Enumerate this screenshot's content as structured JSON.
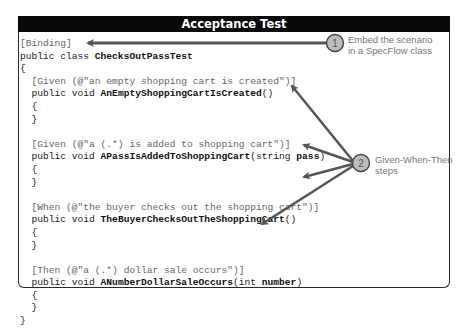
{
  "title": "Acceptance Test",
  "code": {
    "lines": [
      {
        "indent": "",
        "attr": "[Binding]",
        "pre": "",
        "bold": "",
        "post": ""
      },
      {
        "indent": "",
        "attr": "",
        "pre": "public class ",
        "bold": "ChecksOutPassTest",
        "post": ""
      },
      {
        "indent": "",
        "attr": "",
        "pre": "{",
        "bold": "",
        "post": ""
      },
      {
        "indent": "  ",
        "attr": "[Given (@\"an empty shopping cart is created\")]",
        "pre": "",
        "bold": "",
        "post": ""
      },
      {
        "indent": "  ",
        "attr": "",
        "pre": "public void ",
        "bold": "AnEmptyShoppingCartIsCreated",
        "post": "()"
      },
      {
        "indent": "  ",
        "attr": "",
        "pre": "{",
        "bold": "",
        "post": ""
      },
      {
        "indent": "  ",
        "attr": "",
        "pre": "}",
        "bold": "",
        "post": ""
      },
      {
        "indent": "",
        "attr": "",
        "pre": "",
        "bold": "",
        "post": ""
      },
      {
        "indent": "  ",
        "attr": "[Given (@\"a (.*) is added to shopping cart\")]",
        "pre": "",
        "bold": "",
        "post": ""
      },
      {
        "indent": "  ",
        "attr": "",
        "pre": "public void ",
        "bold": "APassIsAddedToShoppingCart",
        "post": "(string ",
        "bold2": "pass",
        "post2": ")"
      },
      {
        "indent": "  ",
        "attr": "",
        "pre": "{",
        "bold": "",
        "post": ""
      },
      {
        "indent": "  ",
        "attr": "",
        "pre": "}",
        "bold": "",
        "post": ""
      },
      {
        "indent": "",
        "attr": "",
        "pre": "",
        "bold": "",
        "post": ""
      },
      {
        "indent": "  ",
        "attr": "[When (@\"the buyer checks out the shopping cart\")]",
        "pre": "",
        "bold": "",
        "post": ""
      },
      {
        "indent": "  ",
        "attr": "",
        "pre": "public void ",
        "bold": "TheBuyerChecksOutTheShoppingCart",
        "post": "()"
      },
      {
        "indent": "  ",
        "attr": "",
        "pre": "{",
        "bold": "",
        "post": ""
      },
      {
        "indent": "  ",
        "attr": "",
        "pre": "}",
        "bold": "",
        "post": ""
      },
      {
        "indent": "",
        "attr": "",
        "pre": "",
        "bold": "",
        "post": ""
      },
      {
        "indent": "  ",
        "attr": "[Then (@\"a (.*) dollar sale occurs\")]",
        "pre": "",
        "bold": "",
        "post": ""
      },
      {
        "indent": "  ",
        "attr": "",
        "pre": "public void ",
        "bold": "ANumberDollarSaleOccurs",
        "post": "(int ",
        "bold2": "number",
        "post2": ")"
      },
      {
        "indent": "  ",
        "attr": "",
        "pre": "{",
        "bold": "",
        "post": ""
      },
      {
        "indent": "  ",
        "attr": "",
        "pre": "}",
        "bold": "",
        "post": ""
      },
      {
        "indent": "",
        "attr": "",
        "pre": "}",
        "bold": "",
        "post": ""
      }
    ]
  },
  "callouts": [
    {
      "number": "1",
      "line1": "Embed the scenario",
      "line2": "in a SpecFlow class"
    },
    {
      "number": "2",
      "line1": "Given-When-Then",
      "line2": "steps"
    }
  ],
  "colors": {
    "title_bg": "#0a0a0a",
    "arrow": "#555555",
    "circle_fill": "#bdbdbd",
    "callout_text": "#777777"
  }
}
